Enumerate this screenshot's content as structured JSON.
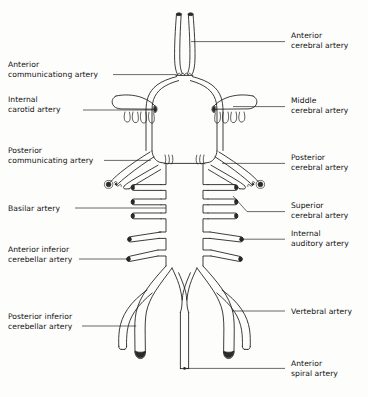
{
  "figure": {
    "background_color": "#fdfdfc",
    "line_color": "#1a1a1a"
  },
  "labels_left": [
    {
      "name": "anterior-communicating-artery",
      "line1": "Anterior",
      "line2": "communicationg artery"
    },
    {
      "name": "internal-carotid-artery",
      "line1": "Internal",
      "line2": "carotid artery"
    },
    {
      "name": "posterior-communicating-artery",
      "line1": "Posterior",
      "line2": "communicating artery"
    },
    {
      "name": "basilar-artery",
      "line1": "Basilar artery",
      "line2": ""
    },
    {
      "name": "anterior-inferior-cerebellar-artery",
      "line1": "Anterior inferior",
      "line2": "cerebellar artery"
    },
    {
      "name": "posterior-inferior-cerebellar-artery",
      "line1": "Posterior inferior",
      "line2": "cerebellar artery"
    }
  ],
  "labels_right": [
    {
      "name": "anterior-cerebral-artery",
      "line1": "Anterior",
      "line2": "cerebral artery"
    },
    {
      "name": "middle-cerebral-artery",
      "line1": "Middle",
      "line2": "cerebral artery"
    },
    {
      "name": "posterior-cerebral-artery",
      "line1": "Posterior",
      "line2": "cerebral artery"
    },
    {
      "name": "superior-cerebral-artery",
      "line1": "Superior",
      "line2": "cerebral artery"
    },
    {
      "name": "internal-auditory-artery",
      "line1": "Internal",
      "line2": "auditory artery"
    },
    {
      "name": "vertebral-artery",
      "line1": "Vertebral artery",
      "line2": ""
    },
    {
      "name": "anterior-spiral-artery",
      "line1": "Anterior",
      "line2": "spiral artery"
    }
  ]
}
